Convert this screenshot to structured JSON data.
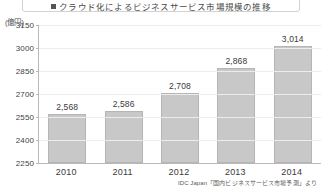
{
  "header": {
    "title": "クラウド化によるビジネスサービス市場規模の推移",
    "bullet_icon": "square-bullet-icon"
  },
  "chart_data": {
    "type": "bar",
    "title": "クラウド化によるビジネスサービス市場規模の推移",
    "unit_label": "(億円)",
    "categories": [
      "2010",
      "2011",
      "2012",
      "2013",
      "2014"
    ],
    "values": [
      2568,
      2586,
      2708,
      2868,
      3014
    ],
    "value_labels": [
      "2,568",
      "2,586",
      "2,708",
      "2,868",
      "3,014"
    ],
    "ylabel": "",
    "xlabel": "",
    "ylim": [
      2250,
      3150
    ],
    "ytick_step": 150,
    "yticks": [
      2250,
      2400,
      2550,
      2700,
      2850,
      3000,
      3150
    ],
    "ytick_labels": [
      "2250",
      "2400",
      "2550",
      "2700",
      "2850",
      "3000",
      "3150"
    ],
    "grid": true,
    "legend": false,
    "bar_color": "#c8c8c8",
    "bar_border_color": "#b5b5b5",
    "grid_color": "#ececec",
    "axis_color": "#b9b9b9"
  },
  "source": {
    "note": "IDC Japan「国内ビジネスサービス市場予測」より"
  }
}
